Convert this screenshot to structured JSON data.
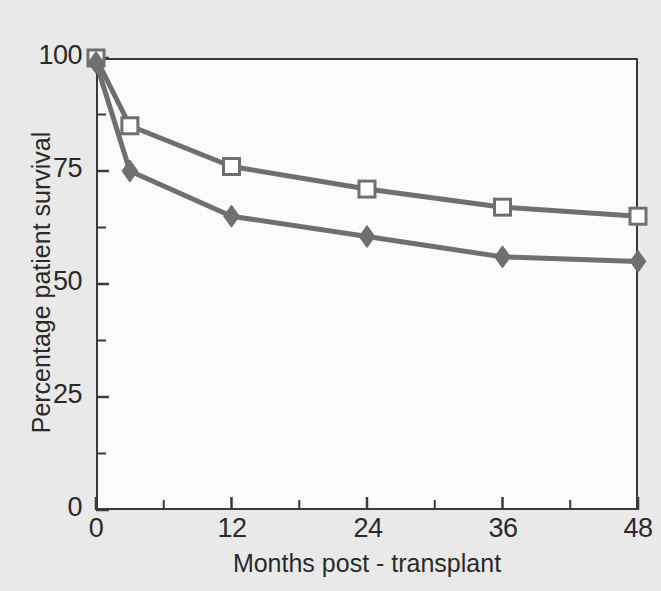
{
  "chart_data": {
    "type": "line",
    "title": "",
    "subtitle": "",
    "xlabel": "Months post - transplant",
    "ylabel": "Percentage patient survival",
    "xlim": [
      0,
      48
    ],
    "ylim": [
      0,
      100
    ],
    "xticks": [
      0,
      12,
      24,
      36,
      48
    ],
    "xtick_labels": [
      "0",
      "12",
      "24",
      "36",
      "48"
    ],
    "xminor_ticks": [
      6,
      18,
      30,
      42
    ],
    "yticks": [
      0,
      25,
      50,
      75,
      100
    ],
    "ytick_labels": [
      "0",
      "25",
      "50",
      "75",
      "100"
    ],
    "yminor_ticks": [
      12.5,
      37.5,
      62.5,
      87.5
    ],
    "grid": false,
    "legend": "none",
    "line_color": "#6f6f6f",
    "axis_color": "#3a3a3a",
    "plot_background": "#fbfbfb",
    "figure_background": "#e9e9e9",
    "x": [
      0,
      3,
      12,
      24,
      36,
      48
    ],
    "series": [
      {
        "name": "Open square series",
        "marker": "open-square",
        "marker_fill": "#ffffff",
        "marker_edge": "#6f6f6f",
        "color": "#6f6f6f",
        "values": [
          100,
          85,
          76,
          71,
          67,
          65
        ]
      },
      {
        "name": "Filled diamond series",
        "marker": "filled-diamond",
        "marker_fill": "#6f6f6f",
        "marker_edge": "#6f6f6f",
        "color": "#6f6f6f",
        "values": [
          99,
          75,
          65,
          60.5,
          56,
          55
        ]
      }
    ]
  },
  "axes": {
    "y_labels": [
      "100",
      "75",
      "50",
      "25",
      "0"
    ],
    "x_labels": [
      "0",
      "12",
      "24",
      "36",
      "48"
    ],
    "x_title": "Months post - transplant",
    "y_title": "Percentage patient survival"
  }
}
